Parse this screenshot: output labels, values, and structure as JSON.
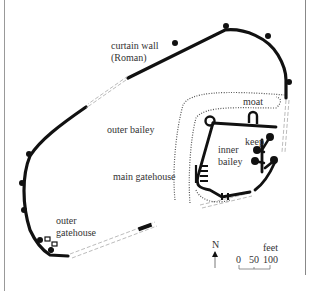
{
  "figure": {
    "type": "castle-plan",
    "labels": {
      "curtain_wall_line1": "curtain wall",
      "curtain_wall_line2": "(Roman)",
      "outer_bailey": "outer bailey",
      "moat": "moat",
      "keep": "keep",
      "inner_bailey_line1": "inner",
      "inner_bailey_line2": "bailey",
      "main_gatehouse": "main gatehouse",
      "outer_gatehouse_line1": "outer",
      "outer_gatehouse_line2": "gatehouse"
    },
    "north_arrow": {
      "label": "N"
    },
    "scale_bar": {
      "unit": "feet",
      "ticks": [
        "0",
        "50",
        "100"
      ]
    },
    "colors": {
      "wall": "#111111",
      "ruined_wall": "#aaaaaa",
      "moat": "#555555",
      "text": "#333333"
    }
  }
}
